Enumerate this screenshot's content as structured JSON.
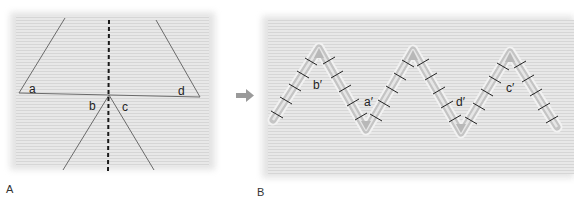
{
  "panels": [
    {
      "id": "A",
      "label": "A",
      "incision_labels": {
        "a": "a",
        "b": "b",
        "c": "c",
        "d": "d"
      }
    },
    {
      "id": "B",
      "label": "B",
      "incision_labels": {
        "b": "b′",
        "a": "a′",
        "d": "d′",
        "c": "c′"
      }
    }
  ],
  "colors": {
    "skin_background": "#e6e6e6",
    "skin_stripe": "#d4d4d4",
    "incision_line": "#6a6a6a",
    "midline_dash": "#1a1a1a",
    "suture_band": "#bdbdbd",
    "suture_stitch": "#222222",
    "arrow": "#9a9a9a"
  },
  "arrow_icon": "right-arrow-icon"
}
